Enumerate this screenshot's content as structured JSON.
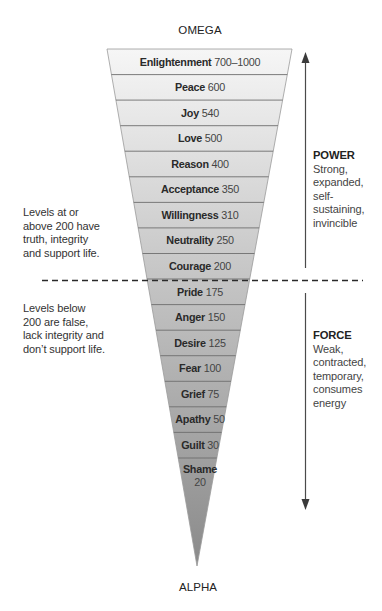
{
  "top_label": "OMEGA",
  "bottom_label": "ALPHA",
  "levels": [
    {
      "name": "Enlightenment",
      "value": "700–1000"
    },
    {
      "name": "Peace",
      "value": "600"
    },
    {
      "name": "Joy",
      "value": "540"
    },
    {
      "name": "Love",
      "value": "500"
    },
    {
      "name": "Reason",
      "value": "400"
    },
    {
      "name": "Acceptance",
      "value": "350"
    },
    {
      "name": "Willingness",
      "value": "310"
    },
    {
      "name": "Neutrality",
      "value": "250"
    },
    {
      "name": "Courage",
      "value": "200"
    },
    {
      "name": "Pride",
      "value": "175"
    },
    {
      "name": "Anger",
      "value": "150"
    },
    {
      "name": "Desire",
      "value": "125"
    },
    {
      "name": "Fear",
      "value": "100"
    },
    {
      "name": "Grief",
      "value": "75"
    },
    {
      "name": "Apathy",
      "value": "50"
    },
    {
      "name": "Guilt",
      "value": "30"
    },
    {
      "name": "Shame",
      "value": "20"
    }
  ],
  "left_notes": {
    "above": [
      "Levels at or",
      "above 200 have",
      "truth, integrity",
      "and support life."
    ],
    "below": [
      "Levels below",
      "200 are false,",
      "lack integrity and",
      "don’t support life."
    ]
  },
  "right_notes": {
    "power": {
      "title": "POWER",
      "lines": [
        "Strong,",
        "expanded,",
        "self-",
        "sustaining,",
        "invincible"
      ]
    },
    "force": {
      "title": "FORCE",
      "lines": [
        "Weak,",
        "contracted,",
        "temporary,",
        "consumes",
        "energy"
      ]
    }
  },
  "colors": {
    "fill_top": "#f4f4f4",
    "fill_bottom": "#8e8e8e",
    "row_line": "#6f6f6f",
    "outline": "#8a8a8a",
    "arrow": "#4a4a4a",
    "dash": "#2a2a2a"
  }
}
